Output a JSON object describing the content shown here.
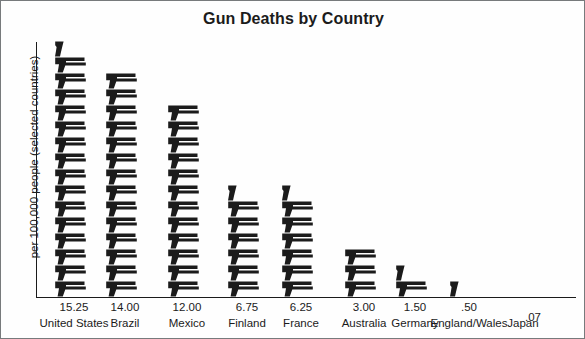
{
  "chart_data": {
    "type": "bar",
    "subtype": "pictogram",
    "title": "Gun Deaths by Country",
    "xlabel": "",
    "ylabel": "per 100,000 people (selected countries)",
    "categories": [
      "United States",
      "Brazil",
      "Mexico",
      "Finland",
      "France",
      "Australia",
      "Germany",
      "England/Wales",
      "Japan"
    ],
    "values": [
      15.25,
      14.0,
      12.0,
      6.75,
      6.25,
      3.0,
      1.5,
      0.5,
      0.07
    ],
    "value_labels": [
      "15.25",
      "14.00",
      "12.00",
      "6.75",
      "6.25",
      "3.00",
      "1.50",
      ".50",
      ".07"
    ],
    "icon": "pistol-icon",
    "icon_unit_value": 1,
    "grid": false,
    "legend": null,
    "ylim": [
      0,
      16
    ]
  },
  "axis": {
    "y_label": "per 100,000 people (selected countries)"
  },
  "colors": {
    "icon": "#1b1b1b",
    "axis": "#1b1b1b",
    "text": "#1b1b1b",
    "background": "#fefefe",
    "border": "#777a7c"
  }
}
